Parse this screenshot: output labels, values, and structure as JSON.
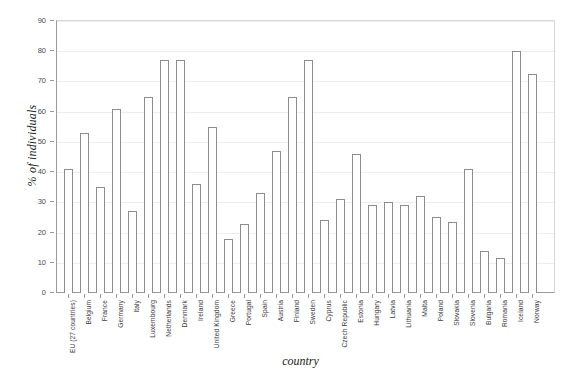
{
  "chart_data": {
    "type": "bar",
    "title": "",
    "xlabel": "country",
    "ylabel": "% of individuals",
    "ylim": [
      0,
      90
    ],
    "ytick_step": 10,
    "yticks": [
      0,
      10,
      20,
      30,
      40,
      50,
      60,
      70,
      80,
      90
    ],
    "grid": true,
    "legend": "none",
    "bar_fill": "#ffffff",
    "bar_border": "#8c8c8c",
    "grid_color": "#ededed",
    "axis_color": "#9a9a9a",
    "categories": [
      "EU (27 countries)",
      "Belgium",
      "France",
      "Germany",
      "Italy",
      "Luxembourg",
      "Netherlands",
      "Denmark",
      "Ireland",
      "United Kingdom",
      "Greece",
      "Portugal",
      "Spain",
      "Austria",
      "Finland",
      "Sweden",
      "Cyprus",
      "Czech Republic",
      "Estonia",
      "Hungary",
      "Latvia",
      "Lithuania",
      "Malta",
      "Poland",
      "Slovakia",
      "Slovenia",
      "Bulgaria",
      "Romania",
      "Iceland",
      "Norway"
    ],
    "values": [
      41,
      53,
      35,
      61,
      27,
      65,
      77,
      77,
      36,
      55,
      18,
      23,
      33,
      47,
      65,
      77,
      24,
      31,
      46,
      29,
      30,
      29,
      32,
      25,
      23.5,
      41,
      14,
      11.5,
      80,
      72.5
    ]
  }
}
